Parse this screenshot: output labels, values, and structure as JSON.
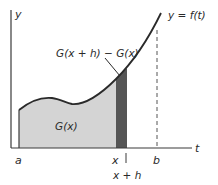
{
  "diagram": {
    "axes": {
      "y_label": "y",
      "t_label": "t"
    },
    "curve_label": "y = f(t)",
    "regions": {
      "area_label": "G(x)",
      "strip_label": "G(x + h) − G(x)"
    },
    "ticks": {
      "a": "a",
      "x": "x",
      "b": "b",
      "x_plus_h": "x + h"
    },
    "colors": {
      "background": "#ffffff",
      "area_fill": "#d4d4d4",
      "strip_fill": "#555555",
      "curve": "#2a2a2a",
      "axis": "#3a3a3a"
    }
  }
}
